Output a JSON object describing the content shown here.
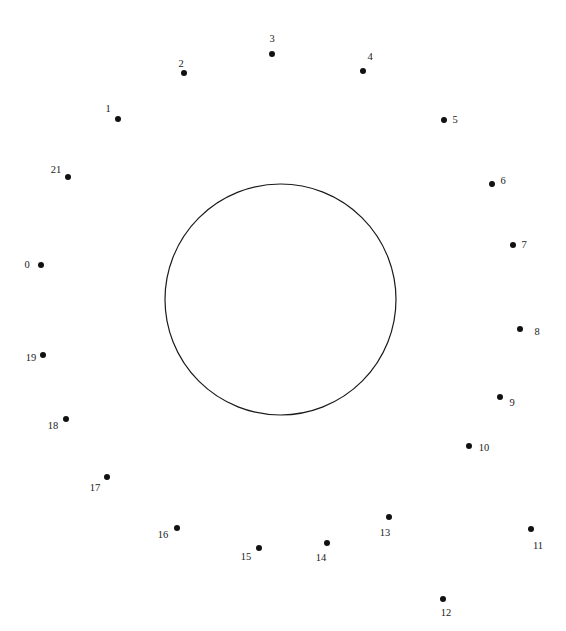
{
  "figure": {
    "type": "connect-the-dots-puzzle",
    "width": 566,
    "height": 631,
    "background_color": "#ffffff",
    "ink_color": "#111111",
    "label_color": "#1a1a1a"
  },
  "shape": {
    "name": "circle-outline",
    "stroke_color": "#1a1a1a",
    "stroke_width": 1.2,
    "fill": "none",
    "center_x": 280.5,
    "center_y": 299.5,
    "radius": 115.5
  },
  "dots": [
    {
      "label": "0",
      "cx": 41,
      "cy": 265,
      "lx": 27,
      "ly": 265
    },
    {
      "label": "1",
      "cx": 118,
      "cy": 119,
      "lx": 108,
      "ly": 109
    },
    {
      "label": "2",
      "cx": 184,
      "cy": 73,
      "lx": 181,
      "ly": 64
    },
    {
      "label": "3",
      "cx": 272,
      "cy": 54,
      "lx": 272,
      "ly": 39
    },
    {
      "label": "4",
      "cx": 363,
      "cy": 71,
      "lx": 370,
      "ly": 57
    },
    {
      "label": "5",
      "cx": 444,
      "cy": 120,
      "lx": 455,
      "ly": 120
    },
    {
      "label": "6",
      "cx": 492,
      "cy": 184,
      "lx": 503,
      "ly": 181
    },
    {
      "label": "7",
      "cx": 513,
      "cy": 245,
      "lx": 524,
      "ly": 245
    },
    {
      "label": "8",
      "cx": 520,
      "cy": 329,
      "lx": 537,
      "ly": 332
    },
    {
      "label": "9",
      "cx": 500,
      "cy": 397,
      "lx": 512,
      "ly": 403
    },
    {
      "label": "10",
      "cx": 469,
      "cy": 446,
      "lx": 484,
      "ly": 448
    },
    {
      "label": "11",
      "cx": 531,
      "cy": 529,
      "lx": 538,
      "ly": 546
    },
    {
      "label": "12",
      "cx": 443,
      "cy": 599,
      "lx": 446,
      "ly": 613
    },
    {
      "label": "13",
      "cx": 389,
      "cy": 517,
      "lx": 385,
      "ly": 533
    },
    {
      "label": "14",
      "cx": 327,
      "cy": 543,
      "lx": 321,
      "ly": 558
    },
    {
      "label": "15",
      "cx": 259,
      "cy": 548,
      "lx": 246,
      "ly": 557
    },
    {
      "label": "16",
      "cx": 177,
      "cy": 528,
      "lx": 163,
      "ly": 535
    },
    {
      "label": "17",
      "cx": 107,
      "cy": 477,
      "lx": 95,
      "ly": 488
    },
    {
      "label": "18",
      "cx": 66,
      "cy": 419,
      "lx": 53,
      "ly": 426
    },
    {
      "label": "19",
      "cx": 43,
      "cy": 355,
      "lx": 31,
      "ly": 358
    },
    {
      "label": "21",
      "cx": 68,
      "cy": 177,
      "lx": 56,
      "ly": 170
    }
  ]
}
